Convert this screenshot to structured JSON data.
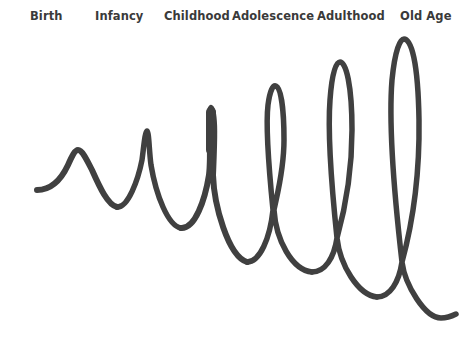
{
  "diagram": {
    "stroke_color": "#404040",
    "background": "#ffffff",
    "stages": [
      {
        "label": "Birth",
        "x": 30
      },
      {
        "label": "Infancy",
        "x": 95
      },
      {
        "label": "Childhood",
        "x": 164
      },
      {
        "label": "Adolescence",
        "x": 232
      },
      {
        "label": "Adulthood",
        "x": 317
      },
      {
        "label": "Old Age",
        "x": 400
      }
    ]
  }
}
